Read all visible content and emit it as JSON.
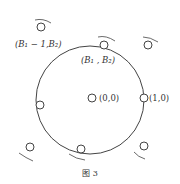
{
  "figure": {
    "caption": "图 3",
    "labels": {
      "b1m1_b2": "(B₁ − 1,B₂)",
      "b1_b2": "(B₁ , B₂)",
      "origin": "(0,0)",
      "one_zero": "(1,0)"
    }
  }
}
